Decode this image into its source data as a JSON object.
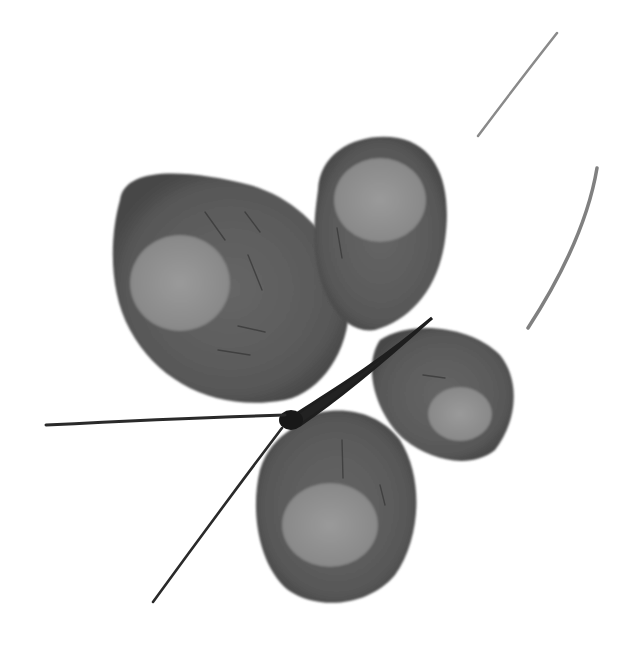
{
  "image": {
    "description": "Grayscale ink-wash painting of a butterfly with four rounded wings, each with a lighter circular spot, a dark slender body, two thin antennae extending to the lower-left, and two faint curved brush strokes at the upper right.",
    "palette": {
      "background": "#ffffff",
      "wing_dark": "#5a5a5a",
      "wing_edge": "#4a4a4a",
      "wing_spot": "#8e8e8e",
      "body": "#1e1e1e",
      "antenna": "#2a2a2a",
      "stroke": "#8a8a8a"
    },
    "subject": "butterfly",
    "style": "ink wash, monochrome"
  }
}
